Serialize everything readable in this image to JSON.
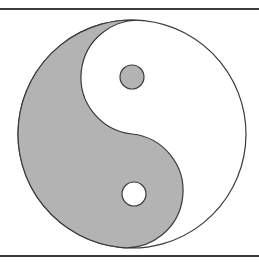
{
  "figure": {
    "type": "yin-yang-symbol",
    "colors": {
      "yin": "#b3b3b3",
      "yang": "#ffffff",
      "outline": "#3a3a3a",
      "frame": "#3a3a3a"
    },
    "circle": {
      "cx": 132,
      "cy": 134,
      "r": 114
    },
    "rotation_deg": 6,
    "dots": [
      {
        "name": "yin-dot-in-yang",
        "cx": 132,
        "cy": 77,
        "r": 12,
        "fill": "#b3b3b3"
      },
      {
        "name": "yang-dot-in-yin",
        "cx": 134,
        "cy": 194,
        "r": 12,
        "fill": "#ffffff"
      }
    ]
  }
}
